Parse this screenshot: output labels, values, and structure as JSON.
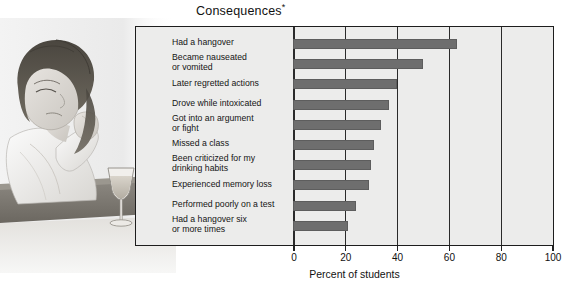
{
  "chart_data": {
    "type": "bar",
    "orientation": "horizontal",
    "title": "Consequences",
    "title_footnote_marker": "*",
    "xlabel": "Percent of students",
    "ylabel": "",
    "xlim": [
      0,
      100
    ],
    "xticks": [
      0,
      20,
      40,
      60,
      80,
      100
    ],
    "xticklabels": [
      "0",
      "20",
      "40",
      "60",
      "80",
      "100"
    ],
    "grid": true,
    "grid_axis": "x",
    "legend": null,
    "categories": [
      "Had a hangover",
      "Became nauseated\nor vomited",
      "Later regretted actions",
      "Drove while intoxicated",
      "Got into an argument\nor fight",
      "Missed a class",
      "Been criticized for my\ndrinking habits",
      "Experienced memory loss",
      "Performed poorly on a test",
      "Had a hangover six\nor more times"
    ],
    "values": [
      63,
      50,
      40,
      37,
      34,
      31,
      30,
      29,
      24,
      21
    ],
    "bar_color": "#6e6e6e",
    "plot_background": "#ececeb",
    "frame_color": "#1d1d1d"
  },
  "illustration": {
    "name": "woman-seated-at-bar-with-wine-glass",
    "description": "Pencil-style drawing of a woman resting her head on her hand at a bar counter beside a wine glass"
  }
}
